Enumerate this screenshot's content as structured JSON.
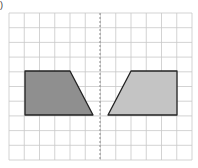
{
  "label": ")",
  "grid": {
    "left": 9,
    "top": 13,
    "cols": 12,
    "rows": 10,
    "cell_w": 15.25,
    "cell_h": 14.7,
    "line_color": "#c8c8c8",
    "border_color": "#bdbdbd"
  },
  "mirror_line": {
    "x": 100,
    "style": "dashed",
    "color": "#888888"
  },
  "shapes": [
    {
      "name": "original-trapezoid",
      "fill": "#8f8f8f",
      "stroke": "#222222",
      "points": [
        [
          25,
          71
        ],
        [
          70,
          71
        ],
        [
          93,
          115
        ],
        [
          25,
          115
        ]
      ]
    },
    {
      "name": "reflected-trapezoid",
      "fill": "#c4c4c4",
      "stroke": "#222222",
      "points": [
        [
          131,
          71
        ],
        [
          177,
          71
        ],
        [
          177,
          115
        ],
        [
          108,
          115
        ]
      ]
    }
  ]
}
